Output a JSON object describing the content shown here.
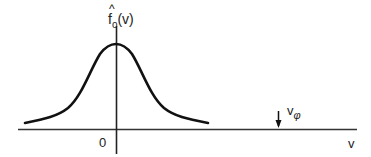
{
  "diagram": {
    "type": "distribution-function-sketch",
    "curve": "bell-shaped distribution centered at v = 0",
    "y_label": {
      "base": "f",
      "hat": "^",
      "subscript": "o",
      "argument": "(v)"
    },
    "x_label": "v",
    "origin_label": "0",
    "marker": {
      "label_base": "v",
      "label_subscript": "φ",
      "description": "downward arrow marking phase velocity on v axis"
    },
    "colors": {
      "stroke": "#1a1a1a",
      "background": "#ffffff"
    }
  }
}
